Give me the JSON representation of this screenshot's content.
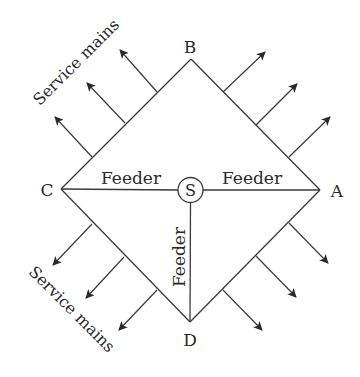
{
  "diagram": {
    "colors": {
      "line": "#3a3a3a",
      "text": "#2a2a2a",
      "background": "#ffffff"
    },
    "nodes": {
      "A": {
        "label": "A",
        "x": 320,
        "y": 190
      },
      "B": {
        "label": "B",
        "x": 191,
        "y": 59
      },
      "C": {
        "label": "C",
        "x": 61,
        "y": 189
      },
      "D": {
        "label": "D",
        "x": 190,
        "y": 322
      },
      "S": {
        "label": "S",
        "x": 190.5,
        "y": 190,
        "r": 12.5
      }
    },
    "edges": [
      {
        "from": "C",
        "to": "B"
      },
      {
        "from": "B",
        "to": "A"
      },
      {
        "from": "A",
        "to": "D"
      },
      {
        "from": "D",
        "to": "C"
      }
    ],
    "feeders": [
      {
        "from": "S",
        "to": "C",
        "label": "Feeder"
      },
      {
        "from": "S",
        "to": "A",
        "label": "Feeder"
      },
      {
        "from": "S",
        "to": "D",
        "label": "Feeder"
      }
    ],
    "service_mains": {
      "label_top": "Service mains",
      "label_bottom": "Service mains",
      "arrows": [
        {
          "x1": 92,
          "y1": 157,
          "x2": 55,
          "y2": 117
        },
        {
          "x1": 125,
          "y1": 123,
          "x2": 87,
          "y2": 83
        },
        {
          "x1": 157,
          "y1": 92,
          "x2": 120,
          "y2": 50
        },
        {
          "x1": 223,
          "y1": 92,
          "x2": 265,
          "y2": 52
        },
        {
          "x1": 256,
          "y1": 125,
          "x2": 297,
          "y2": 84
        },
        {
          "x1": 289,
          "y1": 157,
          "x2": 330,
          "y2": 117
        },
        {
          "x1": 92,
          "y1": 224,
          "x2": 53,
          "y2": 265
        },
        {
          "x1": 124,
          "y1": 257,
          "x2": 86,
          "y2": 298
        },
        {
          "x1": 157,
          "y1": 290,
          "x2": 119,
          "y2": 330
        },
        {
          "x1": 289,
          "y1": 223,
          "x2": 328,
          "y2": 263
        },
        {
          "x1": 256,
          "y1": 256,
          "x2": 296,
          "y2": 297
        },
        {
          "x1": 223,
          "y1": 290,
          "x2": 262,
          "y2": 330
        }
      ]
    }
  }
}
